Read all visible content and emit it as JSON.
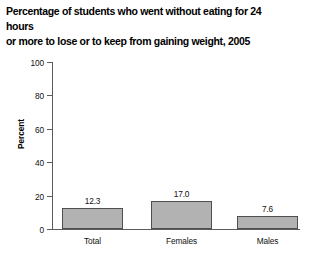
{
  "chart_data": {
    "type": "bar",
    "title": "Percentage of students who went without eating for 24 hours\nor more to lose or to keep from gaining weight, 2005",
    "categories": [
      "Total",
      "Females",
      "Males"
    ],
    "values": [
      12.3,
      17.0,
      7.6
    ],
    "value_labels": [
      "12.3",
      "17.0",
      "7.6"
    ],
    "xlabel": "",
    "ylabel": "Percent",
    "ylim": [
      0,
      100
    ],
    "ytick_labels": [
      "0",
      "20",
      "40",
      "60",
      "80",
      "100"
    ],
    "ytick_values": [
      0,
      20,
      40,
      60,
      80,
      100
    ],
    "grid": false,
    "legend": false,
    "bar_fill_color": "#b2b2b2",
    "bar_edge_color": "#4f4f4f",
    "axis_color": "#5b5b5b",
    "text_color": "#111111",
    "background_color": "#ffffff"
  }
}
